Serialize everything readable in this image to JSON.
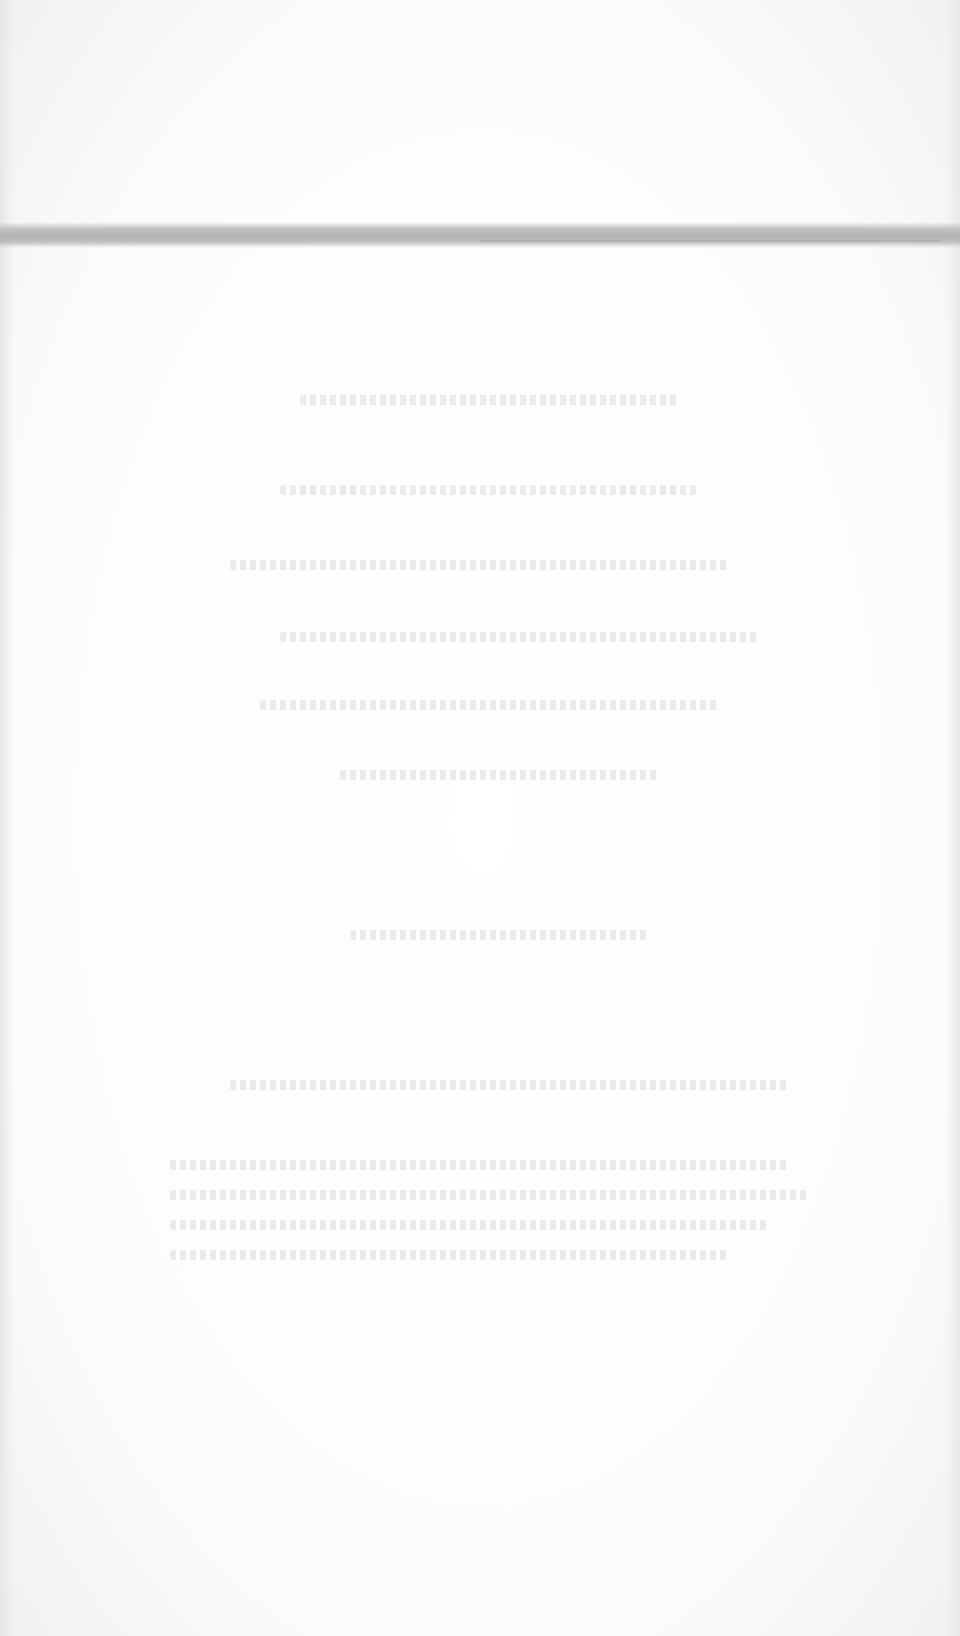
{
  "document": {
    "legibility": "illegible",
    "background_color": "#fbfbfb",
    "band_color": "#b8b8b8",
    "band_top_px": 222,
    "ghost_line_positions": [
      {
        "top": 395,
        "left": 300,
        "width": 380
      },
      {
        "top": 485,
        "left": 280,
        "width": 420
      },
      {
        "top": 560,
        "left": 230,
        "width": 500
      },
      {
        "top": 632,
        "left": 280,
        "width": 480
      },
      {
        "top": 700,
        "left": 260,
        "width": 460
      },
      {
        "top": 770,
        "left": 340,
        "width": 320
      },
      {
        "top": 930,
        "left": 350,
        "width": 300
      },
      {
        "top": 1080,
        "left": 230,
        "width": 560
      },
      {
        "top": 1160,
        "left": 170,
        "width": 620
      },
      {
        "top": 1190,
        "left": 170,
        "width": 640
      },
      {
        "top": 1220,
        "left": 170,
        "width": 600
      },
      {
        "top": 1250,
        "left": 170,
        "width": 560
      }
    ]
  }
}
